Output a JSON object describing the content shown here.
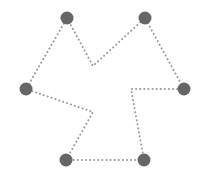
{
  "diagram": {
    "width": 209,
    "height": 188,
    "background": "#ffffff",
    "node_color": "#666666",
    "edge_color": "#999999",
    "node_radius": 6.5,
    "edge_width": 2,
    "edge_dash": "0.1 4",
    "nodes": [
      {
        "id": "top-left",
        "x": 67,
        "y": 18
      },
      {
        "id": "top-right",
        "x": 145,
        "y": 18
      },
      {
        "id": "right",
        "x": 184,
        "y": 89
      },
      {
        "id": "bottom-right",
        "x": 144,
        "y": 160
      },
      {
        "id": "bottom-left",
        "x": 66,
        "y": 160
      },
      {
        "id": "left",
        "x": 26,
        "y": 89
      }
    ],
    "path": [
      [
        67,
        18
      ],
      [
        93,
        66
      ],
      [
        145,
        18
      ],
      [
        184,
        89
      ],
      [
        131,
        89
      ],
      [
        144,
        160
      ],
      [
        66,
        160
      ],
      [
        93,
        112
      ],
      [
        26,
        89
      ],
      [
        67,
        18
      ]
    ]
  }
}
